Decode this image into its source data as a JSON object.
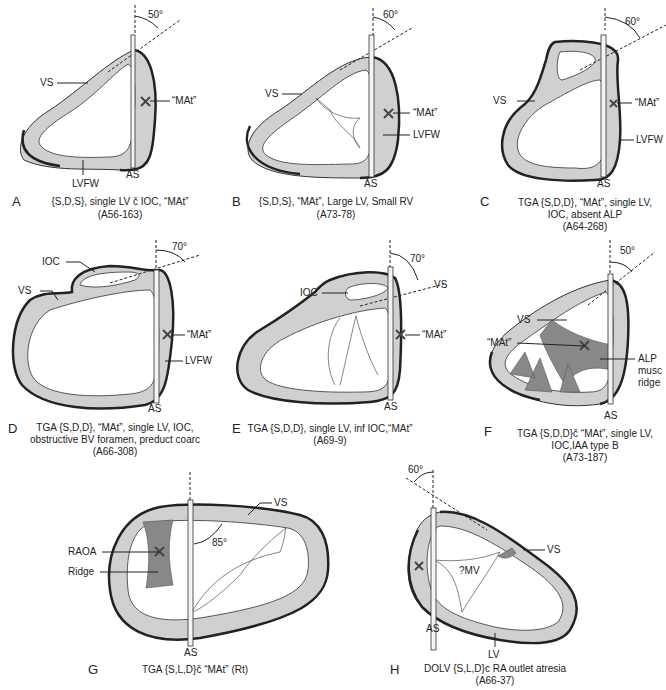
{
  "figure": {
    "panels": [
      {
        "letter": "A",
        "angle": "50°",
        "labels": {
          "vs": "VS",
          "mat": "“MAt”",
          "lvfw": "LVFW",
          "as": "AS"
        },
        "caption_line1": "{S,D,S}, single LV č IOC, “MAt”",
        "caption_line2": "(A56-163)"
      },
      {
        "letter": "B",
        "angle": "60°",
        "labels": {
          "vs": "VS",
          "mat": "“MAt”",
          "lvfw": "LVFW",
          "as": "AS"
        },
        "caption_line1": "{S,D,S}, “MAt”, Large LV, Small RV",
        "caption_line2": "(A73-78)"
      },
      {
        "letter": "C",
        "angle": "60°",
        "labels": {
          "vs": "VS",
          "mat": "“MAt”",
          "lvfw": "LVFW",
          "as": "AS"
        },
        "caption_line1": "TGA {S,D,D}, “MAt”, single LV,",
        "caption_line2": "IOC, absent ALP",
        "caption_line3": "(A64-268)"
      },
      {
        "letter": "D",
        "angle": "70°",
        "labels": {
          "ioc": "IOC",
          "vs": "VS",
          "mat": "“MAt”",
          "lvfw": "LVFW",
          "as": "AS"
        },
        "caption_line1": "TGA {S,D,D}, “MAt”, single LV, IOC,",
        "caption_line2": "obstructive BV foramen, preduct coarc",
        "caption_line3": "(A66-308)"
      },
      {
        "letter": "E",
        "angle": "70°",
        "labels": {
          "ioc": "IOC",
          "vs": "VS",
          "mat": "“MAt”",
          "as": "AS"
        },
        "caption_line1": "TGA {S,D,D}, single LV, inf IOC,“MAt”",
        "caption_line2": "(A69-9)"
      },
      {
        "letter": "F",
        "angle": "50°",
        "labels": {
          "vs": "VS",
          "mat": "“MAt”",
          "alp1": "ALP",
          "alp2": "musc",
          "alp3": "ridge",
          "as": "AS"
        },
        "caption_line1": "TGA {S,D,D}č “MAt”, single LV,",
        "caption_line2": "IOC,IAA type B",
        "caption_line3": "(A73-187)"
      },
      {
        "letter": "G",
        "angle": "85°",
        "labels": {
          "vs": "VS",
          "raoa": "RAOA",
          "ridge": "Ridge",
          "as": "AS"
        },
        "caption_line1": "TGA {S,L,D}č “MAt” (Rt)"
      },
      {
        "letter": "H",
        "angle": "60°",
        "labels": {
          "vs": "VS",
          "mv": "?MV",
          "lv": "LV",
          "as": "AS"
        },
        "caption_line1": "DOLV {S,L,D}c RA outlet atresia",
        "caption_line2": "(A66-37)"
      }
    ]
  }
}
